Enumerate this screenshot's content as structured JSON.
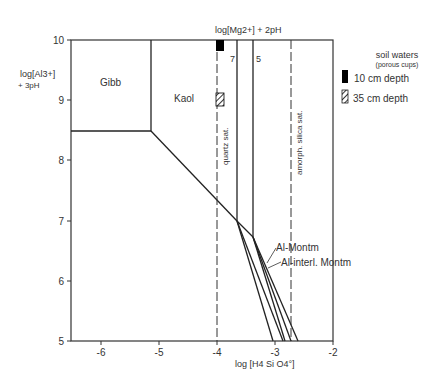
{
  "diagram": {
    "type": "stability_diagram",
    "y_axis": {
      "label_line1": "log[Al3+]",
      "label_line2": "+ 3pH",
      "ticks": [
        "10",
        "9",
        "8",
        "7",
        "6",
        "5"
      ],
      "range": [
        5,
        10
      ]
    },
    "x_axis": {
      "label": "log [H4 Si O4°]",
      "ticks": [
        "-6",
        "-5",
        "-4",
        "-3",
        "-2"
      ],
      "range": [
        -6.5,
        -2
      ]
    },
    "top_label": "log[Mg2+] + 2pH",
    "fields": [
      {
        "name": "Gibb"
      },
      {
        "name": "Kaol"
      },
      {
        "name": "Al-Montm"
      },
      {
        "name": "Al-interl. Montm"
      }
    ],
    "mg_isolines": [
      {
        "label": "7",
        "x": -3.65
      },
      {
        "label": "5",
        "x": -3.4
      }
    ],
    "saturation_lines": [
      {
        "label": "quartz sat.",
        "x": -4
      },
      {
        "label": "amorph. silica sat.",
        "x": -2.7
      }
    ],
    "legend": {
      "title": "soil waters",
      "subtitle": "(porous cups)",
      "items": [
        {
          "label": "10 cm depth",
          "style": "solid",
          "color": "#000000"
        },
        {
          "label": "35 cm depth",
          "style": "hatched",
          "color": "#000000"
        }
      ]
    },
    "samples": [
      {
        "series": "10 cm depth",
        "x": -4,
        "y_top": 10,
        "y_bottom": 9.8
      },
      {
        "series": "35 cm depth",
        "x": -4,
        "y_top": 9.12,
        "y_bottom": 8.9
      }
    ]
  }
}
